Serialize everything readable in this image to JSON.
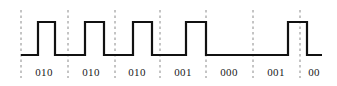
{
  "figure": {
    "width": 337,
    "height": 86,
    "background_color": "#ffffff",
    "trace_color": "#111111",
    "gridline_color": "#8a8a8a",
    "label_color": "#1a1a1a"
  },
  "chart_data": {
    "type": "line",
    "title": "",
    "xlabel": "",
    "ylabel": "",
    "grid": true,
    "legend": null,
    "signal_name": "encoded-bitstream",
    "levels": {
      "low": 0,
      "high": 1,
      "low_y_px": 55,
      "high_y_px": 22
    },
    "axis_range_x_px": [
      21,
      322
    ],
    "gridlines_x_px": [
      21,
      68,
      115,
      160,
      206,
      253,
      300
    ],
    "segment_labels": [
      "010",
      "010",
      "010",
      "001",
      "000",
      "001",
      "00"
    ],
    "segment_label_x_px": [
      44,
      91,
      137,
      183,
      229,
      276,
      314
    ],
    "segment_label_y_px": 66,
    "waveform_points_px": [
      [
        21,
        55
      ],
      [
        38,
        55
      ],
      [
        38,
        22
      ],
      [
        55,
        22
      ],
      [
        55,
        55
      ],
      [
        85,
        55
      ],
      [
        85,
        22
      ],
      [
        104,
        22
      ],
      [
        104,
        55
      ],
      [
        133,
        55
      ],
      [
        133,
        22
      ],
      [
        152,
        22
      ],
      [
        152,
        55
      ],
      [
        186,
        55
      ],
      [
        186,
        22
      ],
      [
        206,
        22
      ],
      [
        206,
        55
      ],
      [
        288,
        55
      ],
      [
        288,
        22
      ],
      [
        307,
        22
      ],
      [
        307,
        55
      ],
      [
        322,
        55
      ]
    ],
    "transitions": [
      {
        "x_px": 38,
        "edge": "rising"
      },
      {
        "x_px": 55,
        "edge": "falling"
      },
      {
        "x_px": 85,
        "edge": "rising"
      },
      {
        "x_px": 104,
        "edge": "falling"
      },
      {
        "x_px": 133,
        "edge": "rising"
      },
      {
        "x_px": 152,
        "edge": "falling"
      },
      {
        "x_px": 186,
        "edge": "rising"
      },
      {
        "x_px": 206,
        "edge": "falling"
      },
      {
        "x_px": 288,
        "edge": "rising"
      },
      {
        "x_px": 307,
        "edge": "falling"
      }
    ]
  }
}
